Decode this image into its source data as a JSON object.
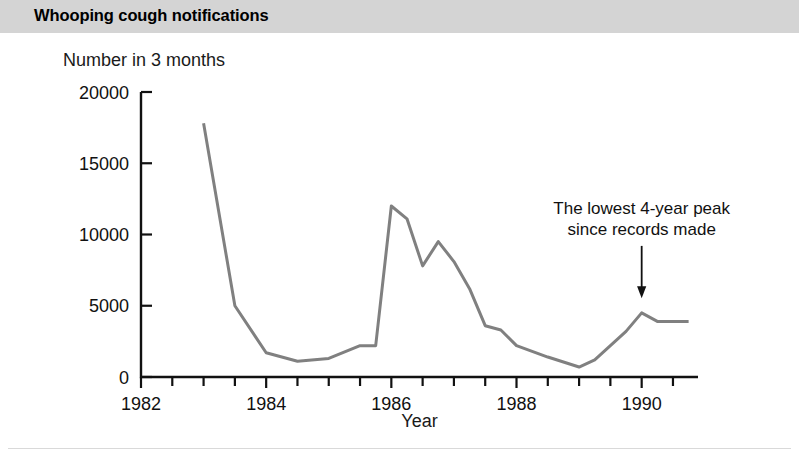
{
  "header": {
    "title": "Whooping cough notifications"
  },
  "chart_data": {
    "type": "line",
    "title": "Whooping cough notifications",
    "xlabel": "Year",
    "ylabel": "Number in 3 months",
    "xlim": [
      1982,
      1990.9
    ],
    "ylim": [
      0,
      20000
    ],
    "xticks": [
      1982,
      1984,
      1986,
      1988,
      1990
    ],
    "xtick_labels": [
      "1982",
      "1984",
      "1986",
      "1988",
      "1990"
    ],
    "xminor_step": 0.5,
    "yticks": [
      0,
      5000,
      10000,
      15000,
      20000
    ],
    "ytick_labels": [
      "0",
      "5000",
      "10000",
      "15000",
      "20000"
    ],
    "grid": false,
    "legend": null,
    "series": [
      {
        "name": "Whooping cough notifications",
        "color": "#808080",
        "line_width": 3,
        "x": [
          1983.0,
          1983.5,
          1984.0,
          1984.5,
          1985.0,
          1985.5,
          1985.75,
          1986.0,
          1986.25,
          1986.5,
          1986.75,
          1987.0,
          1987.25,
          1987.5,
          1987.75,
          1988.0,
          1988.5,
          1989.0,
          1989.25,
          1989.75,
          1990.0,
          1990.25,
          1990.75
        ],
        "y": [
          17800,
          5000,
          1700,
          1100,
          1300,
          2200,
          2200,
          12000,
          11100,
          7800,
          9500,
          8100,
          6200,
          3600,
          3300,
          2200,
          1400,
          700,
          1200,
          3200,
          4500,
          3900,
          3900
        ]
      }
    ],
    "annotations": [
      {
        "name": "lowest-peak-callout",
        "lines": [
          "The lowest 4-year peak",
          "since records made"
        ],
        "arrow_x": 1990.0,
        "arrow_from_y": 9200,
        "arrow_to_y": 5600
      }
    ]
  }
}
